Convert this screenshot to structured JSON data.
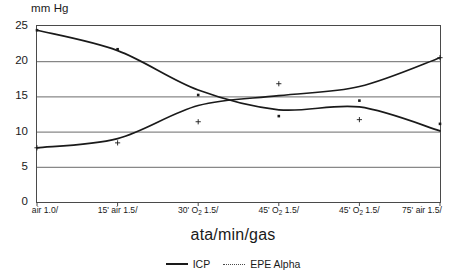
{
  "chart_data": {
    "type": "line",
    "title": "",
    "xlabel": "ata/min/gas",
    "ylabel": "mm Hg",
    "ylim": [
      0,
      25
    ],
    "yticks": [
      0,
      5,
      10,
      15,
      20,
      25
    ],
    "grid": true,
    "legend_position": "bottom",
    "categories": [
      "air 1.0/",
      "15' air 1.5/",
      "30' O2 1.5/",
      "45' O2 1.5/",
      "45' O2 1.5/",
      "75' air 1.5/"
    ],
    "xtick_labels_html": [
      "air 1.0/",
      "15' air 1.5/",
      "30' O<sub>2</sub> 1.5/",
      "45' O<sub>2</sub> 1.5/",
      "45' O<sub>2</sub> 1.5/",
      "75' air 1.5/"
    ],
    "series": [
      {
        "name": "ICP",
        "style": "solid-line-with-square-markers",
        "color": "#1a1a1a",
        "marker": "square",
        "values": [
          24.4,
          21.7,
          15.2,
          12.2,
          14.4,
          11.1
        ],
        "curve_values": [
          24.4,
          21.5,
          15.9,
          13.1,
          13.5,
          10.1
        ]
      },
      {
        "name": "EPE Alpha",
        "style": "dotted-legend-solid-curve-with-plus-markers",
        "color": "#1a1a1a",
        "marker": "plus",
        "values": [
          7.7,
          8.4,
          11.4,
          16.8,
          11.7,
          20.5
        ],
        "curve_values": [
          7.7,
          9.0,
          13.7,
          15.1,
          16.4,
          20.5
        ]
      }
    ],
    "legend": [
      {
        "label": "ICP",
        "swatch": "solid"
      },
      {
        "label": "EPE Alpha",
        "swatch": "dotted"
      }
    ]
  },
  "axes": {
    "y_title": "mm Hg",
    "x_title": "ata/min/gas",
    "y_tick_0": "0",
    "y_tick_5": "5",
    "y_tick_10": "10",
    "y_tick_15": "15",
    "y_tick_20": "20",
    "y_tick_25": "25"
  },
  "legend_labels": {
    "icp": "ICP",
    "epe_alpha": "EPE Alpha"
  },
  "colors": {
    "line": "#1a1a1a",
    "grid": "#6b6b6b",
    "frame": "#4a4a4a",
    "background": "#ffffff"
  }
}
